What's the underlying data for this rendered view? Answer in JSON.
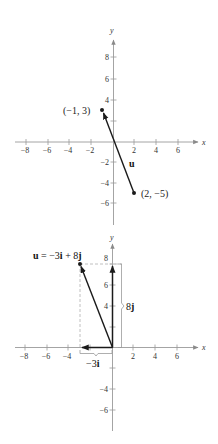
{
  "figure_top": {
    "x_axis_name": "x",
    "y_axis_name": "y",
    "x_ticks": [
      {
        "value": -8,
        "label": "−8"
      },
      {
        "value": -6,
        "label": "−6"
      },
      {
        "value": -4,
        "label": "−4"
      },
      {
        "value": -2,
        "label": "−2"
      },
      {
        "value": 2,
        "label": "2"
      },
      {
        "value": 4,
        "label": "4"
      },
      {
        "value": 6,
        "label": "6"
      }
    ],
    "y_ticks": [
      {
        "value": 8,
        "label": "8"
      },
      {
        "value": 6,
        "label": "6"
      },
      {
        "value": 4,
        "label": "4"
      },
      {
        "value": 2,
        "label": ""
      },
      {
        "value": -2,
        "label": "−2"
      },
      {
        "value": -4,
        "label": "−4"
      },
      {
        "value": -6,
        "label": "−6"
      }
    ],
    "initial_point": {
      "x": 2,
      "y": -5,
      "label": "(2,  −5)"
    },
    "terminal_point": {
      "x": -1,
      "y": 3,
      "label": "(−1,  3)"
    },
    "vector_name": "u"
  },
  "figure_bottom": {
    "x_axis_name": "x",
    "y_axis_name": "y",
    "x_ticks": [
      {
        "value": -8,
        "label": "−8"
      },
      {
        "value": -6,
        "label": "−6"
      },
      {
        "value": -4,
        "label": "−4"
      },
      {
        "value": 2,
        "label": "2"
      },
      {
        "value": 4,
        "label": "4"
      },
      {
        "value": 6,
        "label": "6"
      }
    ],
    "y_ticks": [
      {
        "value": 8,
        "label": "8"
      },
      {
        "value": 6,
        "label": "6"
      },
      {
        "value": 4,
        "label": "4"
      },
      {
        "value": 2,
        "label": ""
      },
      {
        "value": -2,
        "label": ""
      },
      {
        "value": -4,
        "label": "−4"
      },
      {
        "value": -6,
        "label": "−6"
      }
    ],
    "vector_point": {
      "x": -3,
      "y": 8
    },
    "equation": {
      "u": "u",
      "eq": " = −3",
      "i": "i",
      "plus": " + 8",
      "j": "j"
    },
    "i_component_label": {
      "coef": "−3",
      "unit": "i"
    },
    "j_component_label": {
      "coef": "8",
      "unit": "j"
    }
  },
  "colors": {
    "axis": "#9a9a9a",
    "vector": "#1a1a1a",
    "dashed": "#b0b0b0"
  }
}
